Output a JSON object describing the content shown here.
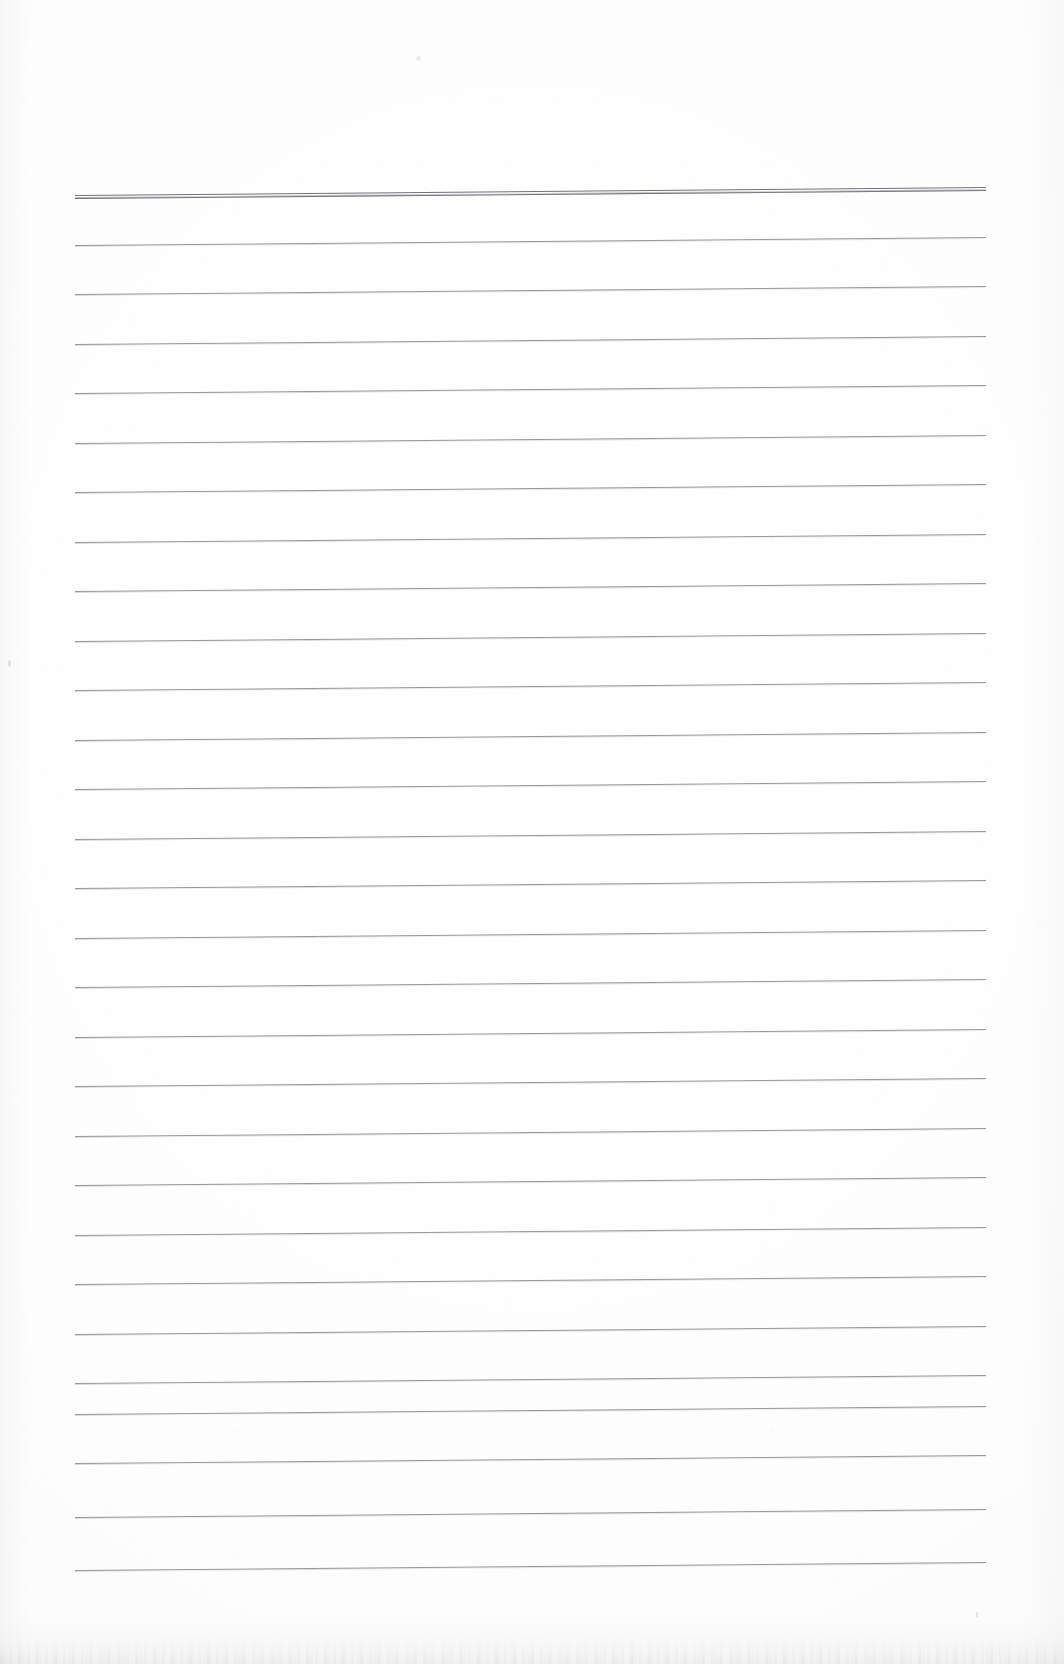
{
  "document": {
    "kind": "scanned-ruled-paper",
    "title": "Blank ruled notebook page (scan)",
    "page_width": 1064,
    "page_height": 1664,
    "background_color": "#fdfdfd",
    "has_visible_text": false,
    "text_content": ""
  },
  "ruling": {
    "line_color": "#8d8f94",
    "header_line_color": "#70737a",
    "line_count": 29,
    "line_left_x": 75,
    "line_right_x": 986,
    "line_length": 911,
    "first_line_y": 195,
    "line_spacing": 49.5,
    "slope_rise_px": -8,
    "line_thickness": 1,
    "header_line_index": 0,
    "header_line_thickness": 3,
    "lines": [
      {
        "index": 0,
        "y": 195,
        "style": "header-double"
      },
      {
        "index": 1,
        "y": 244.5,
        "style": "single"
      },
      {
        "index": 2,
        "y": 294,
        "style": "single"
      },
      {
        "index": 3,
        "y": 343.5,
        "style": "single"
      },
      {
        "index": 4,
        "y": 393,
        "style": "single"
      },
      {
        "index": 5,
        "y": 442.5,
        "style": "single"
      },
      {
        "index": 6,
        "y": 492,
        "style": "single"
      },
      {
        "index": 7,
        "y": 541.5,
        "style": "single"
      },
      {
        "index": 8,
        "y": 591,
        "style": "single"
      },
      {
        "index": 9,
        "y": 640.5,
        "style": "single"
      },
      {
        "index": 10,
        "y": 690,
        "style": "single"
      },
      {
        "index": 11,
        "y": 739.5,
        "style": "single"
      },
      {
        "index": 12,
        "y": 789,
        "style": "single"
      },
      {
        "index": 13,
        "y": 838.5,
        "style": "single"
      },
      {
        "index": 14,
        "y": 888,
        "style": "single"
      },
      {
        "index": 15,
        "y": 937.5,
        "style": "single"
      },
      {
        "index": 16,
        "y": 987,
        "style": "single"
      },
      {
        "index": 17,
        "y": 1036.5,
        "style": "single"
      },
      {
        "index": 18,
        "y": 1086,
        "style": "single"
      },
      {
        "index": 19,
        "y": 1135.5,
        "style": "single"
      },
      {
        "index": 20,
        "y": 1185,
        "style": "single"
      },
      {
        "index": 21,
        "y": 1234.5,
        "style": "single"
      },
      {
        "index": 22,
        "y": 1284,
        "style": "single"
      },
      {
        "index": 23,
        "y": 1333.5,
        "style": "single"
      },
      {
        "index": 24,
        "y": 1383,
        "style": "single"
      },
      {
        "index": 25,
        "y": 1413.5,
        "style": "single"
      },
      {
        "index": 26,
        "y": 1463,
        "style": "single"
      },
      {
        "index": 27,
        "y": 1517,
        "style": "single"
      },
      {
        "index": 28,
        "y": 1570,
        "style": "single"
      }
    ]
  },
  "scan_artifacts": {
    "bottom_edge_texture": true,
    "specks": [
      {
        "x": 8,
        "y": 660,
        "w": 3,
        "h": 7
      },
      {
        "x": 976,
        "y": 1612,
        "w": 2,
        "h": 6
      },
      {
        "x": 416,
        "y": 56,
        "w": 5,
        "h": 5
      }
    ]
  }
}
